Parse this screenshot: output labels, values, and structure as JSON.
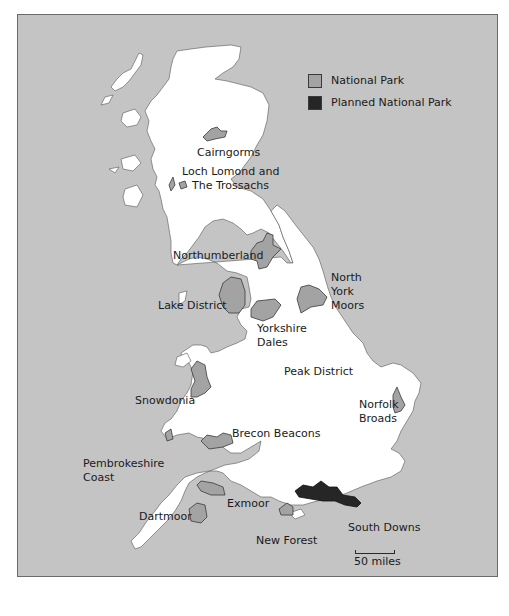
{
  "map": {
    "colors": {
      "sea": "#c4c4c4",
      "land": "#ffffff",
      "national_park": "#a3a3a3",
      "planned_national_park": "#262626",
      "outline": "#3a3a3a"
    },
    "legend": {
      "items": [
        {
          "label": "National Park",
          "color": "#a3a3a3"
        },
        {
          "label": "Planned National Park",
          "color": "#262626"
        }
      ]
    },
    "labels": {
      "cairngorms": "Cairngorms",
      "loch_lomond_1": "Loch Lomond and",
      "loch_lomond_2": "The Trossachs",
      "northumberland": "Northumberland",
      "north_york_1": "North",
      "north_york_2": "York",
      "north_york_3": "Moors",
      "lake_district": "Lake District",
      "yorkshire_dales_1": "Yorkshire",
      "yorkshire_dales_2": "Dales",
      "peak_district": "Peak District",
      "snowdonia": "Snowdonia",
      "norfolk_1": "Norfolk",
      "norfolk_2": "Broads",
      "brecon": "Brecon Beacons",
      "pembrokeshire_1": "Pembrokeshire",
      "pembrokeshire_2": "Coast",
      "exmoor": "Exmoor",
      "dartmoor": "Dartmoor",
      "south_downs": "South Downs",
      "new_forest": "New Forest"
    },
    "scale": {
      "label": "50 miles"
    }
  }
}
